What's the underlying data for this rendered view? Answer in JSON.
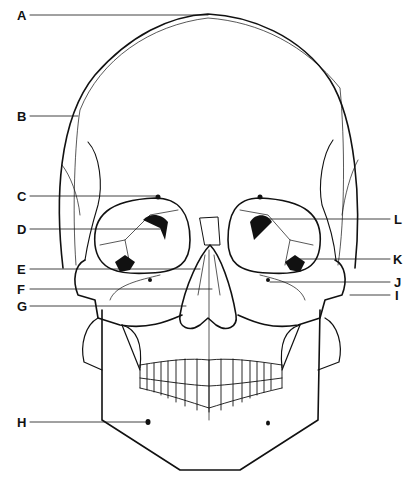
{
  "labels": [
    {
      "id": "A",
      "text": "A",
      "x": 17,
      "y": 10,
      "line": [
        [
          30,
          15
        ],
        [
          208,
          15
        ]
      ]
    },
    {
      "id": "B",
      "text": "B",
      "x": 17,
      "y": 111,
      "line": [
        [
          30,
          116
        ],
        [
          78,
          116
        ]
      ]
    },
    {
      "id": "C",
      "text": "C",
      "x": 17,
      "y": 191,
      "line": [
        [
          30,
          196
        ],
        [
          158,
          196
        ]
      ]
    },
    {
      "id": "D",
      "text": "D",
      "x": 17,
      "y": 224,
      "line": [
        [
          30,
          229
        ],
        [
          160,
          229
        ]
      ]
    },
    {
      "id": "E",
      "text": "E",
      "x": 17,
      "y": 264,
      "line": [
        [
          30,
          269
        ],
        [
          200,
          269
        ]
      ]
    },
    {
      "id": "F",
      "text": "F",
      "x": 17,
      "y": 284,
      "line": [
        [
          30,
          289
        ],
        [
          212,
          289
        ]
      ]
    },
    {
      "id": "G",
      "text": "G",
      "x": 17,
      "y": 301,
      "line": [
        [
          30,
          306
        ],
        [
          186,
          306
        ]
      ]
    },
    {
      "id": "H",
      "text": "H",
      "x": 17,
      "y": 417,
      "line": [
        [
          30,
          422
        ],
        [
          148,
          422
        ]
      ]
    },
    {
      "id": "I",
      "text": "I",
      "x": 394,
      "y": 291,
      "line": [
        [
          350,
          295
        ],
        [
          390,
          295
        ]
      ]
    },
    {
      "id": "J",
      "text": "J",
      "x": 394,
      "y": 276,
      "line": [
        [
          270,
          282
        ],
        [
          390,
          282
        ]
      ]
    },
    {
      "id": "K",
      "text": "K",
      "x": 394,
      "y": 254,
      "line": [
        [
          300,
          259
        ],
        [
          390,
          259
        ]
      ]
    },
    {
      "id": "L",
      "text": "L",
      "x": 394,
      "y": 214,
      "line": [
        [
          262,
          219
        ],
        [
          390,
          219
        ]
      ]
    }
  ],
  "colors": {
    "stroke": "#111111",
    "background": "#ffffff"
  }
}
